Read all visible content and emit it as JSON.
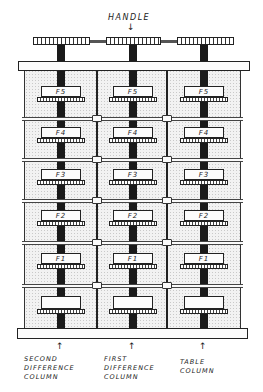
{
  "diagram": {
    "type": "mechanical-illustration",
    "handle": {
      "label": "HANDLE"
    },
    "rows": [
      {
        "label": "F5"
      },
      {
        "label": "F4"
      },
      {
        "label": "F3"
      },
      {
        "label": "F2"
      },
      {
        "label": "F1"
      },
      {
        "label": ""
      }
    ],
    "columns": [
      {
        "id": "second",
        "label_lines": [
          "SECOND",
          "DIFFERENCE",
          "COLUMN"
        ]
      },
      {
        "id": "first",
        "label_lines": [
          "FIRST",
          "DIFFERENCE",
          "COLUMN"
        ]
      },
      {
        "id": "table",
        "label_lines": [
          "TABLE",
          "COLUMN"
        ]
      }
    ],
    "colors": {
      "ink": "#1a1a1a",
      "stipple": "#f2f2f2",
      "paper": "#ffffff"
    }
  }
}
